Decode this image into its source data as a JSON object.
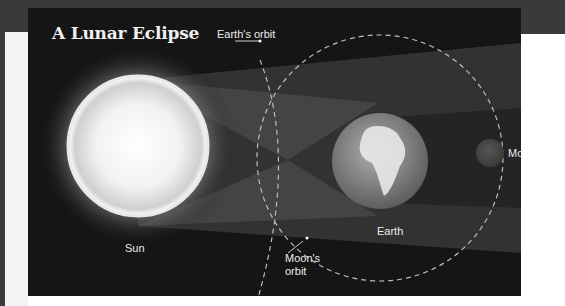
{
  "title": "A Lunar Eclipse",
  "labels": {
    "earths_orbit": "Earth's orbit",
    "sun": "Sun",
    "moon": "Moon",
    "earth": "Earth",
    "moons_orbit_line1": "Moon's",
    "moons_orbit_line2": "orbit"
  },
  "colors": {
    "background": "#151515",
    "sun_core": "#ffffff",
    "sun_glow": "#9a9a9a",
    "penumbra": "#4a4a4a",
    "umbra": "#2a2a2a",
    "earth": "#8c8c8c",
    "moon": "#444444",
    "orbit": "#bdbdbd"
  }
}
